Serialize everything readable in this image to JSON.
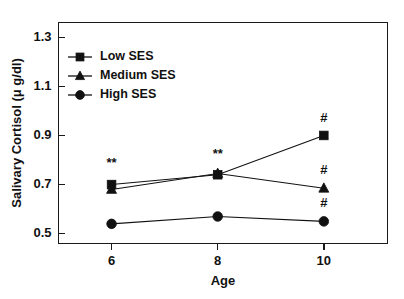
{
  "chart_data": {
    "type": "line",
    "title": "",
    "subtitle": "",
    "xlabel": "Age",
    "ylabel": "Salivary Cortisol (μ g/dl)",
    "x": [
      6,
      8,
      10
    ],
    "categories": [
      "6",
      "8",
      "10"
    ],
    "xlim": [
      5.0,
      11.2
    ],
    "ylim": [
      0.46,
      1.36
    ],
    "yticks": [
      0.5,
      0.7,
      0.9,
      1.1,
      1.3
    ],
    "ytick_labels": [
      "0.5",
      "0.7",
      "0.9",
      "1.1",
      "1.3"
    ],
    "xticks": [
      6,
      8,
      10
    ],
    "xtick_labels": [
      "6",
      "8",
      "10"
    ],
    "grid": false,
    "legend_position": "upper-left-inside",
    "series": [
      {
        "name": "Low SES",
        "marker": "square",
        "color": "#111111",
        "values": [
          0.7,
          0.74,
          0.9
        ]
      },
      {
        "name": "Medium SES",
        "marker": "triangle",
        "color": "#111111",
        "values": [
          0.68,
          0.745,
          0.685
        ]
      },
      {
        "name": "High SES",
        "marker": "circle",
        "color": "#111111",
        "values": [
          0.54,
          0.57,
          0.55
        ]
      }
    ],
    "annotations": [
      {
        "text": "**",
        "x": 6,
        "y": 0.77,
        "note": "significance marker above age 6 cluster"
      },
      {
        "text": "**",
        "x": 8,
        "y": 0.81,
        "note": "significance marker above age 8 cluster"
      },
      {
        "text": "#",
        "x": 10,
        "y": 0.955,
        "note": "significance marker above Low SES at age 10"
      },
      {
        "text": "#",
        "x": 10,
        "y": 0.742,
        "note": "significance marker above Medium SES at age 10"
      },
      {
        "text": "#",
        "x": 10,
        "y": 0.608,
        "note": "significance marker above High SES at age 10"
      }
    ]
  },
  "legend": {
    "entries": [
      {
        "label": "Low SES"
      },
      {
        "label": "Medium SES"
      },
      {
        "label": "High SES"
      }
    ]
  },
  "axes": {
    "y_title": "Salivary Cortisol (μ g/dl)",
    "x_title": "Age"
  }
}
